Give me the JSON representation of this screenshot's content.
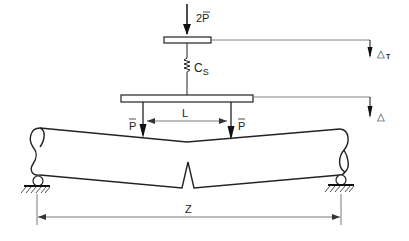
{
  "diagram": {
    "type": "beam-test-schematic",
    "labels": {
      "top_load": "2P̄",
      "top_load_base": "2P",
      "spring": "C",
      "spring_sub": "S",
      "span_inner": "L",
      "left_load": "P",
      "right_load": "P",
      "span_outer": "Z",
      "delta_top": "△",
      "delta_top_sub": "T",
      "delta_beam": "△"
    },
    "colors": {
      "stroke": "#222222",
      "dim": "#555555",
      "background": "#ffffff"
    }
  }
}
